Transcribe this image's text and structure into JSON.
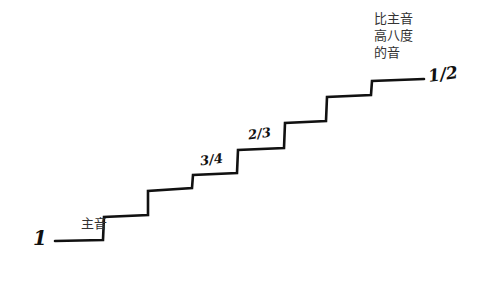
{
  "diagram": {
    "type": "staircase-scale",
    "line_color": "#111111",
    "background": "#ffffff",
    "labels": {
      "start_number": "1",
      "tonic": "主音",
      "octave_line1": "比主音",
      "octave_line2": "高八度",
      "octave_line3": "的音",
      "ratio_three_quarters": "3/4",
      "ratio_two_thirds": "2/3",
      "ratio_half": "1/2"
    },
    "steps": [
      {
        "index": 0,
        "name": "tonic",
        "x_start": 55,
        "x_end": 103,
        "y": 241
      },
      {
        "index": 1,
        "x_start": 103,
        "x_end": 148,
        "y": 216
      },
      {
        "index": 2,
        "x_start": 148,
        "x_end": 192,
        "y": 190
      },
      {
        "index": 3,
        "x_start": 192,
        "x_end": 237,
        "y": 175,
        "ratio": "3/4"
      },
      {
        "index": 4,
        "x_start": 237,
        "x_end": 285,
        "y": 149,
        "ratio": "2/3"
      },
      {
        "index": 5,
        "x_start": 285,
        "x_end": 327,
        "y": 122
      },
      {
        "index": 6,
        "x_start": 327,
        "x_end": 372,
        "y": 96
      },
      {
        "index": 7,
        "name": "octave",
        "x_start": 372,
        "x_end": 424,
        "y": 80,
        "ratio": "1/2"
      }
    ]
  }
}
